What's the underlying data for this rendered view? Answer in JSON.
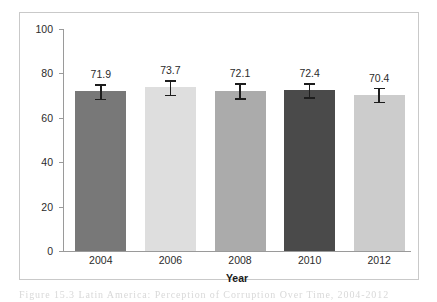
{
  "figure": {
    "caption": "Figure 15.3 Latin America: Perception of Corruption Over Time, 2004-2012"
  },
  "chart_data": {
    "type": "bar",
    "title": "",
    "xlabel": "Year",
    "ylabel": "Perception of corruption",
    "categories": [
      "2004",
      "2006",
      "2008",
      "2010",
      "2012"
    ],
    "values": [
      71.9,
      73.7,
      72.1,
      72.4,
      70.4
    ],
    "value_labels": [
      "71.9",
      "73.7",
      "72.1",
      "72.4",
      "70.4"
    ],
    "errors": [
      3.3,
      3.3,
      3.4,
      3.2,
      3.2
    ],
    "error_low": [
      68.6,
      70.4,
      68.7,
      69.2,
      67.2
    ],
    "error_high": [
      75.2,
      77.0,
      75.5,
      75.6,
      73.6
    ],
    "ylim": [
      0,
      100
    ],
    "yticks": [
      0,
      20,
      40,
      60,
      80,
      100
    ],
    "ytick_labels": [
      "0",
      "20",
      "40",
      "60",
      "80",
      "100"
    ],
    "grid": false,
    "legend": "none",
    "bar_colors": [
      "#787878",
      "#dedede",
      "#ababab",
      "#4a4a4a",
      "#cccccc"
    ],
    "errorbar_color": "#1d1d1d",
    "axis_color": "#9a9a9a",
    "background": "#ffffff"
  }
}
